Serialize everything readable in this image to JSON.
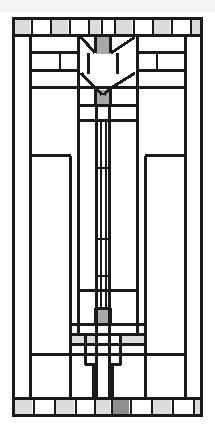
{
  "artwork": {
    "title": "Prairie School Stained Glass Window Panel",
    "style_name": "frank-lloyd-wright-art-glass",
    "motif": "stylized-tulip",
    "canvas": {
      "width": 215,
      "height": 432
    },
    "background_color": "#ffffff",
    "colors": {
      "came_lead": "#1a1a1a",
      "came_lead_thin": "#262626",
      "glass_clear": "#ffffff",
      "glass_light_gray": "#dcdcdc",
      "glass_mid_gray": "#a8a8a8",
      "glass_dark_gray": "#8f8f8f",
      "canvas_background": "#ffffff",
      "top_strip": "#f4f4f4"
    },
    "frame": {
      "left": 12,
      "top": 17,
      "right": 203,
      "bottom": 417,
      "border_width": 3
    },
    "line_weights": {
      "frame": 3,
      "heavy": 3,
      "medium": 2,
      "light": 1.4
    },
    "border_rows": {
      "top": {
        "y": 19,
        "height": 16,
        "cell_fills": [
          "light",
          "clear",
          "light",
          "clear",
          "light",
          "clear",
          "light",
          "clear",
          "light",
          "clear",
          "light",
          "clear",
          "light"
        ]
      },
      "bottom": {
        "y": 399,
        "height": 16,
        "cell_fills": [
          "light",
          "clear",
          "light",
          "clear",
          "light",
          "dark",
          "clear",
          "light",
          "clear",
          "light",
          "clear",
          "light"
        ]
      }
    },
    "accent_squares": [
      {
        "name": "upper-tulip-bud",
        "x": 97,
        "y": 37,
        "w": 12,
        "h": 16,
        "fill": "mid"
      },
      {
        "name": "upper-stem-node",
        "x": 97,
        "y": 91,
        "w": 12,
        "h": 14,
        "fill": "mid"
      },
      {
        "name": "lower-stem-node",
        "x": 97,
        "y": 310,
        "w": 12,
        "h": 14,
        "fill": "mid"
      },
      {
        "name": "lower-left-pane",
        "x": 71,
        "y": 336,
        "w": 25,
        "h": 8,
        "fill": "light"
      },
      {
        "name": "lower-right-pane",
        "x": 119,
        "y": 336,
        "w": 25,
        "h": 8,
        "fill": "light"
      },
      {
        "name": "bottom-foot-node",
        "x": 97,
        "y": 399,
        "w": 12,
        "h": 16,
        "fill": "dark"
      }
    ],
    "legend": {
      "panel_label": "Art Glass Panel",
      "orientation": "vertical",
      "symmetry": "bilateral"
    }
  }
}
